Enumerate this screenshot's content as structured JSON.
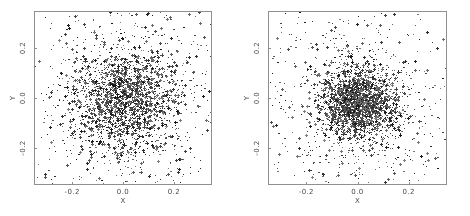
{
  "figure": {
    "background_color": "#ffffff",
    "frame_color": "#8f8f8f",
    "point_color": "#262626",
    "tick_label_color": "#4a4a4a"
  },
  "chart_data": [
    {
      "type": "scatter",
      "panel": "left",
      "title": "",
      "xlabel": "X",
      "ylabel": "Y",
      "xlim": [
        -0.35,
        0.35
      ],
      "ylim": [
        -0.35,
        0.35
      ],
      "xticks": [
        -0.2,
        0.0,
        0.2
      ],
      "yticks": [
        -0.2,
        0.0,
        0.2
      ],
      "xticklabels": [
        "-0.2",
        "0.0",
        "0.2"
      ],
      "yticklabels": [
        "-0.2",
        "0.0",
        "0.2"
      ],
      "grid": false,
      "legend": "none",
      "n_points": 3000,
      "marker": "dot",
      "marker_size": 1,
      "distribution": "radial-gaussian-with-uniform-halo",
      "center": [
        0.0,
        0.0
      ],
      "core_sigma": 0.105,
      "halo_fraction": 0.34,
      "seed": 17
    },
    {
      "type": "scatter",
      "panel": "right",
      "title": "",
      "xlabel": "X",
      "ylabel": "Y",
      "xlim": [
        -0.35,
        0.35
      ],
      "ylim": [
        -0.35,
        0.35
      ],
      "xticks": [
        -0.2,
        0.0,
        0.2
      ],
      "yticks": [
        -0.2,
        0.0,
        0.2
      ],
      "xticklabels": [
        "-0.2",
        "0.0",
        "0.2"
      ],
      "yticklabels": [
        "-0.2",
        "0.0",
        "0.2"
      ],
      "grid": false,
      "legend": "none",
      "n_points": 3100,
      "marker": "dot",
      "marker_size": 1,
      "distribution": "radial-gaussian-with-uniform-halo",
      "center": [
        0.0,
        -0.02
      ],
      "core_sigma": 0.072,
      "halo_fraction": 0.3,
      "seed": 43
    }
  ]
}
